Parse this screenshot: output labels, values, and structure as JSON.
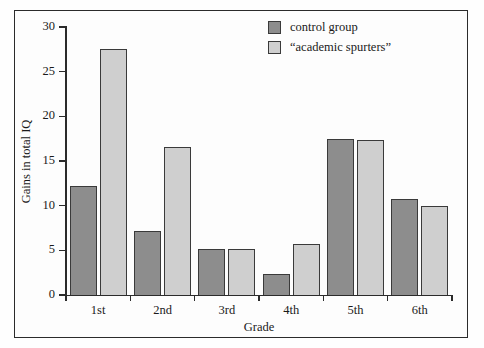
{
  "chart_data": {
    "type": "bar",
    "title": "",
    "subtitle": "",
    "xlabel": "Grade",
    "ylabel": "Gains in total IQ",
    "categories": [
      "1st",
      "2nd",
      "3rd",
      "4th",
      "5th",
      "6th"
    ],
    "series": [
      {
        "name": "control group",
        "color": "#8d8d8d",
        "values": [
          12.2,
          7.2,
          5.1,
          2.3,
          17.5,
          10.7
        ]
      },
      {
        "name": "“academic spurters”",
        "color": "#cfcfcf",
        "values": [
          27.5,
          16.6,
          5.1,
          5.7,
          17.4,
          10.0
        ]
      }
    ],
    "ylim": [
      0,
      30
    ],
    "yticks": [
      0,
      5,
      10,
      15,
      20,
      25,
      30
    ],
    "ytick_labels": [
      "0",
      "5",
      "10",
      "15",
      "20",
      "25",
      "30"
    ],
    "grid": false,
    "legend_position": "top-right",
    "legend_entries": [
      "control group",
      "“academic spurters”"
    ],
    "bar_border_color": "#3a3a3a",
    "axis_color": "#2b2b2b",
    "frame_color": "#2b2b2b",
    "background_color": "#fdfdfd"
  }
}
